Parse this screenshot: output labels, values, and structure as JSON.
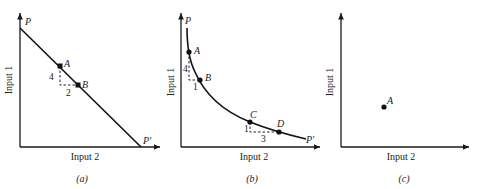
{
  "panels": [
    {
      "id": "a",
      "caption": "(a)",
      "xlabel": "Input 2",
      "ylabel": "Input 1",
      "curve_start_label": "P",
      "curve_end_label": "P′",
      "curve_type": "straight line",
      "points": [
        {
          "label": "A"
        },
        {
          "label": "B"
        }
      ],
      "step_labels": {
        "vertical": "4",
        "horizontal": "2"
      }
    },
    {
      "id": "b",
      "caption": "(b)",
      "xlabel": "Input 2",
      "ylabel": "Input 1",
      "curve_start_label": "P",
      "curve_end_label": "P′",
      "curve_type": "convex curve",
      "points": [
        {
          "label": "A"
        },
        {
          "label": "B"
        },
        {
          "label": "C"
        },
        {
          "label": "D"
        }
      ],
      "step_labels": [
        {
          "vertical": "4",
          "horizontal": "1"
        },
        {
          "vertical": "1",
          "horizontal": "3"
        }
      ]
    },
    {
      "id": "c",
      "caption": "(c)",
      "xlabel": "Input 2",
      "ylabel": "Input 1",
      "points": [
        {
          "label": "A"
        }
      ]
    }
  ]
}
